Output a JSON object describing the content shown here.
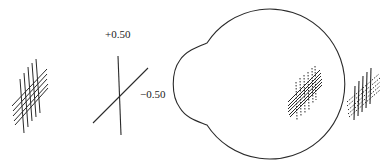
{
  "diagram": {
    "type": "optics-illustration",
    "colors": {
      "line": "#2a2a2a",
      "background": "#ffffff"
    },
    "lens_labels": {
      "plus": "+0.50",
      "minus": "−0.50"
    },
    "elements": [
      {
        "id": "object-grid",
        "description": "crossed line grid (object)"
      },
      {
        "id": "cross-cylinder",
        "description": "two crossed lines with power labels"
      },
      {
        "id": "eye-outline",
        "description": "schematic eye with corneal bulge"
      },
      {
        "id": "retinal-image",
        "description": "blurred crossed grid on retina (solid diagonals, dotted verticals)"
      },
      {
        "id": "perceived-image",
        "description": "blurred crossed grid outside eye (solid verticals, dotted diagonals)"
      }
    ]
  }
}
